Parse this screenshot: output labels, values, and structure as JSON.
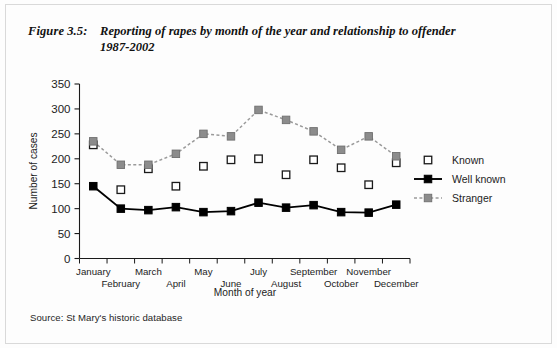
{
  "figure": {
    "label": "Figure 3.5:",
    "title_line1": "Reporting of rapes by month of the year and relationship to offender",
    "title_line2": "1987-2002",
    "source": "Source: St Mary's historic database"
  },
  "colors": {
    "known_marker_fill": "#ffffff",
    "known_marker_stroke": "#1a1a1a",
    "well_known_marker_fill": "#000000",
    "well_known_line": "#000000",
    "stranger_marker_fill": "#8c8c8c",
    "stranger_line": "#9a9a9a",
    "axis": "#1a1a1a",
    "frame": "#d9d9d9",
    "background": "#fdfdfd"
  },
  "chart_data": {
    "type": "line",
    "title": "Reporting of rapes by month of the year and relationship to offender 1987-2002",
    "xlabel": "Month of year",
    "ylabel": "Number of cases",
    "ylim": [
      0,
      350
    ],
    "yticks": [
      0,
      50,
      100,
      150,
      200,
      250,
      300,
      350
    ],
    "ytick_labels": [
      "0",
      "50",
      "100",
      "150",
      "200",
      "250",
      "300",
      "350"
    ],
    "grid": false,
    "legend_position": "right",
    "categories": [
      "January",
      "February",
      "March",
      "April",
      "May",
      "June",
      "July",
      "August",
      "September",
      "October",
      "November",
      "December"
    ],
    "series": [
      {
        "name": "Known",
        "marker": "open-square",
        "line": "none",
        "values": [
          228,
          138,
          180,
          145,
          185,
          198,
          200,
          168,
          198,
          182,
          148,
          192
        ]
      },
      {
        "name": "Well known",
        "marker": "filled-square",
        "line": "solid",
        "values": [
          145,
          100,
          97,
          103,
          93,
          95,
          112,
          102,
          107,
          93,
          92,
          108
        ]
      },
      {
        "name": "Stranger",
        "marker": "gray-square",
        "line": "dashed",
        "values": [
          235,
          188,
          188,
          210,
          250,
          245,
          298,
          278,
          255,
          218,
          245,
          205
        ]
      }
    ]
  },
  "legend": {
    "items": [
      {
        "label": "Known"
      },
      {
        "label": "Well known"
      },
      {
        "label": "Stranger"
      }
    ]
  }
}
